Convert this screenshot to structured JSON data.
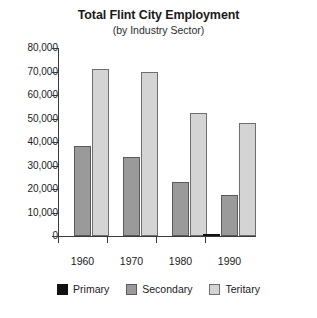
{
  "chart_data": {
    "type": "bar",
    "title": "Total Flint City Employment",
    "subtitle": "(by Industry Sector)",
    "xlabel": "",
    "ylabel": "",
    "categories": [
      "1960",
      "1970",
      "1980",
      "1990"
    ],
    "series": [
      {
        "name": "Primary",
        "color": "#111111",
        "values": [
          0,
          0,
          0,
          1000
        ]
      },
      {
        "name": "Secondary",
        "color": "#9a9a9a",
        "values": [
          38500,
          33500,
          23000,
          17500
        ]
      },
      {
        "name": "Teritary",
        "color": "#d4d4d4",
        "values": [
          71000,
          70000,
          52500,
          48000
        ]
      }
    ],
    "ylim": [
      0,
      80000
    ],
    "ytick_values": [
      0,
      10000,
      20000,
      30000,
      40000,
      50000,
      60000,
      70000,
      80000
    ],
    "ytick_labels": [
      "0",
      "10,000",
      "20,000",
      "30,000",
      "40,000",
      "50,000",
      "60,000",
      "70,000",
      "80,000"
    ],
    "grid": false,
    "legend_position": "bottom"
  },
  "legend": {
    "items": [
      {
        "label": "Primary",
        "swatch": "primary-swatch"
      },
      {
        "label": "Secondary",
        "swatch": "secondary-swatch"
      },
      {
        "label": "Teritary",
        "swatch": "tertiary-swatch"
      }
    ]
  }
}
